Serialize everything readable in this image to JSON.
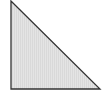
{
  "diagram": {
    "shape": "right-triangle",
    "right_angle_corner": "bottom-left",
    "fill_color": "#e4e4e4",
    "hatch_color": "#d2d2d2",
    "stroke_color": "#333333"
  }
}
